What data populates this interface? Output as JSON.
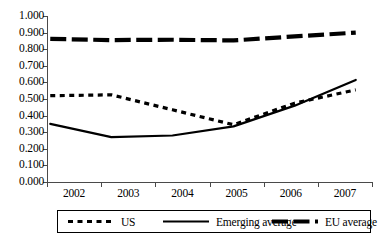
{
  "chart_data": {
    "type": "line",
    "title": "",
    "subtitle": "",
    "xlabel": "",
    "ylabel": "",
    "x": [
      "2002",
      "2003",
      "2004",
      "2005",
      "2006",
      "2007"
    ],
    "categories": [
      "2002",
      "2003",
      "2004",
      "2005",
      "2006",
      "2007"
    ],
    "ylim": [
      0.0,
      1.0
    ],
    "y_tick_labels": [
      "0.000",
      "0.100",
      "0.200",
      "0.300",
      "0.400",
      "0.500",
      "0.600",
      "0.700",
      "0.800",
      "0.900",
      "1.000"
    ],
    "y_tick_values": [
      0.0,
      0.1,
      0.2,
      0.3,
      0.4,
      0.5,
      0.6,
      0.7,
      0.8,
      0.9,
      1.0
    ],
    "grid": false,
    "legend_position": "bottom",
    "series": [
      {
        "name": "US",
        "style": "dotted",
        "color": "#000000",
        "values": [
          0.52,
          0.525,
          0.435,
          0.345,
          0.475,
          0.555
        ]
      },
      {
        "name": "Emerging average",
        "style": "solid",
        "color": "#000000",
        "values": [
          0.35,
          0.27,
          0.28,
          0.335,
          0.46,
          0.615
        ]
      },
      {
        "name": "EU average",
        "style": "dashed",
        "color": "#000000",
        "values": [
          0.862,
          0.855,
          0.857,
          0.853,
          0.877,
          0.9
        ]
      }
    ]
  },
  "axis": {
    "y_labels": [
      "1.000",
      "0.900",
      "0.800",
      "0.700",
      "0.600",
      "0.500",
      "0.400",
      "0.300",
      "0.200",
      "0.100",
      "0.000"
    ],
    "x_labels": [
      "2002",
      "2003",
      "2004",
      "2005",
      "2006",
      "2007"
    ]
  },
  "legend": {
    "items": [
      {
        "label": "US",
        "style": "dotted"
      },
      {
        "label": "Emerging average",
        "style": "solid"
      },
      {
        "label": "EU average",
        "style": "dashed"
      }
    ]
  }
}
